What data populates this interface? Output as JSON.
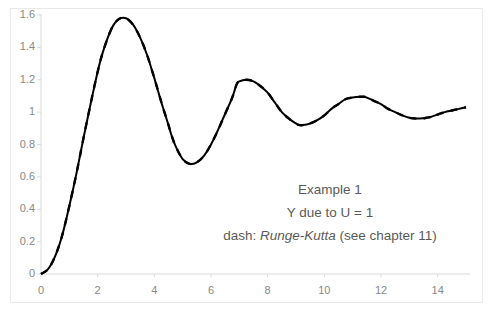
{
  "chart_data": {
    "type": "line",
    "title": "",
    "subtitle": "",
    "xlabel": "",
    "ylabel": "",
    "xlim": [
      0,
      15
    ],
    "ylim": [
      0,
      1.6
    ],
    "grid": false,
    "legend_position": "none",
    "xticks": [
      "0",
      "2",
      "4",
      "6",
      "8",
      "10",
      "12",
      "14"
    ],
    "xtick_values": [
      0,
      2,
      4,
      6,
      8,
      10,
      12,
      14
    ],
    "yticks": [
      "0",
      "0.2",
      "0.4",
      "0.6",
      "0.8",
      "1",
      "1.2",
      "1.4",
      "1.6"
    ],
    "ytick_values": [
      0,
      0.2,
      0.4,
      0.6,
      0.8,
      1,
      1.2,
      1.4,
      1.6
    ],
    "axis_color": "#d9d9d9",
    "tick_text_color": "#888888",
    "series": [
      {
        "name": "Y due to U = 1",
        "style": "solid",
        "color": "#000000",
        "width": 2.0,
        "x": [
          0.0,
          0.25,
          0.5,
          0.75,
          1.0,
          1.25,
          1.5,
          1.75,
          2.0,
          2.2,
          2.5,
          2.75,
          3.0,
          3.25,
          3.5,
          3.75,
          4.0,
          4.25,
          4.5,
          4.6,
          4.75,
          5.0,
          5.25,
          5.5,
          5.75,
          6.0,
          6.25,
          6.5,
          6.75,
          6.9,
          7.0,
          7.25,
          7.5,
          7.75,
          8.0,
          8.25,
          8.5,
          8.75,
          9.0,
          9.1,
          9.25,
          9.5,
          9.75,
          10.0,
          10.25,
          10.5,
          10.75,
          11.0,
          11.25,
          11.4,
          11.5,
          11.75,
          12.0,
          12.25,
          12.5,
          12.75,
          13.0,
          13.25,
          13.5,
          13.6,
          13.75,
          14.0,
          14.25,
          14.5,
          14.75,
          15.0
        ],
        "y": [
          0.0,
          0.03,
          0.11,
          0.24,
          0.42,
          0.62,
          0.84,
          1.05,
          1.25,
          1.38,
          1.52,
          1.575,
          1.58,
          1.54,
          1.46,
          1.35,
          1.21,
          1.06,
          0.92,
          0.86,
          0.79,
          0.71,
          0.68,
          0.69,
          0.73,
          0.8,
          0.89,
          0.99,
          1.09,
          1.17,
          1.19,
          1.2,
          1.19,
          1.16,
          1.12,
          1.06,
          1.0,
          0.96,
          0.93,
          0.921,
          0.92,
          0.93,
          0.95,
          0.98,
          1.02,
          1.05,
          1.08,
          1.09,
          1.095,
          1.095,
          1.09,
          1.07,
          1.05,
          1.02,
          1.0,
          0.98,
          0.965,
          0.96,
          0.962,
          0.965,
          0.97,
          0.985,
          1.0,
          1.01,
          1.02,
          1.03
        ]
      },
      {
        "name": "dash: Runge-Kutta (see chapter 11)",
        "style": "dashed",
        "color": "#000000",
        "width": 2.4,
        "dash_pattern": "7 7",
        "x": [
          0.0,
          0.25,
          0.5,
          0.75,
          1.0,
          1.25,
          1.5,
          1.75,
          2.0,
          2.2,
          2.5,
          2.75,
          3.0,
          3.25,
          3.5,
          3.75,
          4.0,
          4.25,
          4.5,
          4.6,
          4.75,
          5.0,
          5.25,
          5.5,
          5.75,
          6.0,
          6.25,
          6.5,
          6.75,
          6.9,
          7.0,
          7.25,
          7.5,
          7.75,
          8.0,
          8.25,
          8.5,
          8.75,
          9.0,
          9.1,
          9.25,
          9.5,
          9.75,
          10.0,
          10.25,
          10.5,
          10.75,
          11.0,
          11.25,
          11.4,
          11.5,
          11.75,
          12.0,
          12.25,
          12.5,
          12.75,
          13.0,
          13.25,
          13.5,
          13.6,
          13.75,
          14.0,
          14.25,
          14.5,
          14.75,
          15.0
        ],
        "y": [
          0.0,
          0.03,
          0.11,
          0.24,
          0.42,
          0.62,
          0.84,
          1.05,
          1.25,
          1.38,
          1.52,
          1.575,
          1.58,
          1.54,
          1.46,
          1.35,
          1.21,
          1.06,
          0.92,
          0.86,
          0.79,
          0.71,
          0.68,
          0.69,
          0.73,
          0.8,
          0.89,
          0.99,
          1.09,
          1.17,
          1.19,
          1.2,
          1.19,
          1.16,
          1.12,
          1.06,
          1.0,
          0.96,
          0.93,
          0.921,
          0.92,
          0.93,
          0.95,
          0.98,
          1.02,
          1.05,
          1.08,
          1.09,
          1.095,
          1.095,
          1.09,
          1.07,
          1.05,
          1.02,
          1.0,
          0.98,
          0.965,
          0.96,
          0.962,
          0.965,
          0.97,
          0.985,
          1.0,
          1.01,
          1.02,
          1.03
        ]
      }
    ],
    "annotations": [
      {
        "text": "Example 1"
      },
      {
        "text": "Y due to U = 1"
      },
      {
        "text_before": "dash: ",
        "text_em": "Runge-Kutta",
        "text_after": " (see chapter 11)"
      }
    ]
  }
}
